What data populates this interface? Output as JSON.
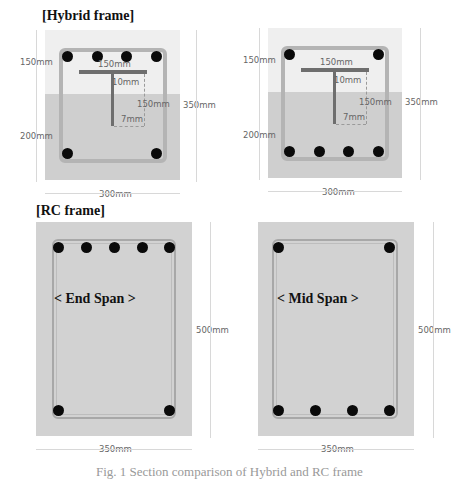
{
  "figure": {
    "hybrid": {
      "title": "[Hybrid frame]",
      "end_section": {
        "top_height": "150mm",
        "bottom_height": "200mm",
        "total_height": "350mm",
        "width": "300mm",
        "flange_width": "150mm",
        "flange_thickness": "10mm",
        "web_depth": "150mm",
        "web_thickness": "7mm",
        "top_bars": 4,
        "bottom_bars": 2
      },
      "mid_section": {
        "top_height": "150mm",
        "bottom_height": "200mm",
        "total_height": "350mm",
        "width": "300mm",
        "flange_width": "150mm",
        "flange_thickness": "10mm",
        "web_depth": "150mm",
        "web_thickness": "7mm",
        "top_bars": 2,
        "bottom_bars": 4
      }
    },
    "rc": {
      "title": "[RC frame]",
      "end_span": {
        "label": "< End Span >",
        "height": "500mm",
        "width": "350mm",
        "top_bars": 5,
        "bottom_bars": 2
      },
      "mid_span": {
        "label": "< Mid Span >",
        "height": "500mm",
        "width": "350mm",
        "top_bars": 2,
        "bottom_bars": 4
      }
    },
    "caption": "Fig. 1 Section comparison of Hybrid and RC frame"
  },
  "colors": {
    "concrete_top": "#efefef",
    "concrete_bottom": "#cfcfcf",
    "concrete_rc": "#d2d2d2",
    "rebar": "#0a0a0a",
    "steel_section": "#6e6e6e"
  }
}
